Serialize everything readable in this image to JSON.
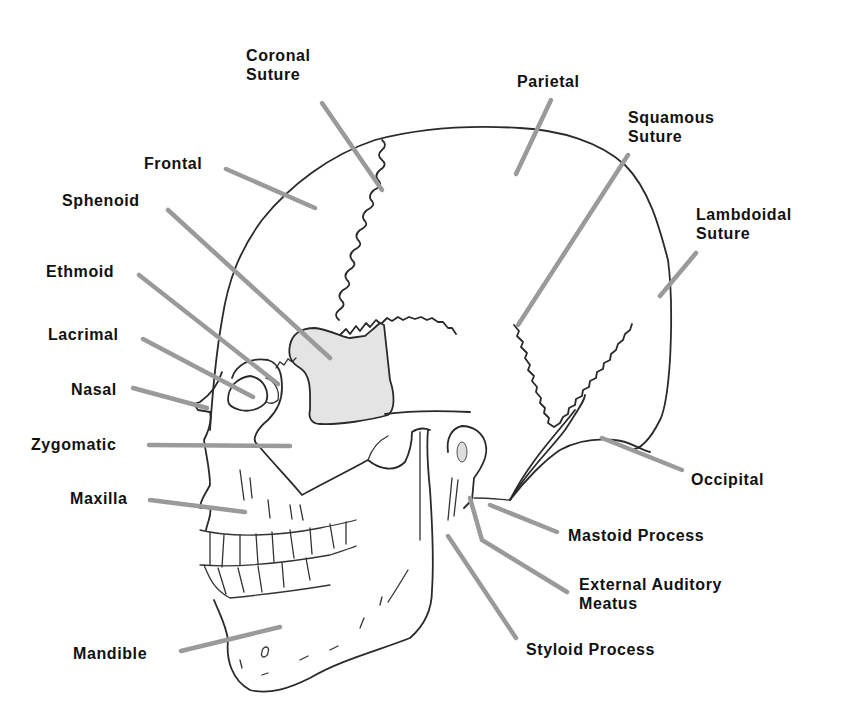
{
  "diagram": {
    "title_fragment": "y",
    "colors": {
      "outline": "#2a2a2a",
      "leader_line": "#9a9a9a",
      "sphenoid_shade": "#e4e4e4",
      "label": "#111111"
    },
    "labels": {
      "coronal_suture": {
        "line1": "Coronal",
        "line2": "Suture"
      },
      "parietal": "Parietal",
      "squamous_suture": {
        "line1": "Squamous",
        "line2": "Suture"
      },
      "lambdoidal_suture": {
        "line1": "Lambdoidal",
        "line2": "Suture"
      },
      "frontal": "Frontal",
      "sphenoid": "Sphenoid",
      "ethmoid": "Ethmoid",
      "lacrimal": "Lacrimal",
      "nasal": "Nasal",
      "zygomatic": "Zygomatic",
      "maxilla": "Maxilla",
      "mandible": "Mandible",
      "occipital": "Occipital",
      "mastoid_process": "Mastoid Process",
      "external_auditory_meatus": {
        "line1": "External Auditory",
        "line2": "Meatus"
      },
      "styloid_process": "Styloid Process"
    }
  }
}
